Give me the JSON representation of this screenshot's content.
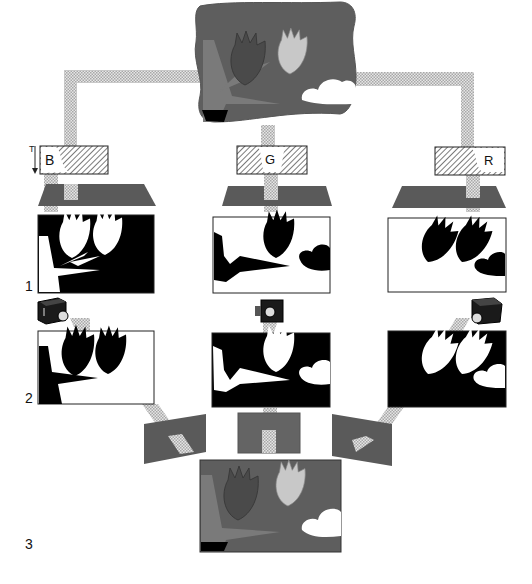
{
  "diagram": {
    "colors": {
      "background": "#ffffff",
      "scene_bg": "#5e5e5e",
      "stem": "#7a7a7a",
      "flower_dark": "#4a4a4a",
      "flower_light": "#c8c8c8",
      "cloud": "#ffffff",
      "filter_plate": "#5a5a5a",
      "light_path": "#cfcfcf",
      "mask_black": "#000000"
    },
    "filters": [
      {
        "letter": "B",
        "name": "blue-filter"
      },
      {
        "letter": "G",
        "name": "green-filter"
      },
      {
        "letter": "R",
        "name": "red-filter"
      }
    ],
    "row_labels": {
      "negatives": "1",
      "positives": "2",
      "combined": "3"
    },
    "filter_axis_label": "T"
  }
}
